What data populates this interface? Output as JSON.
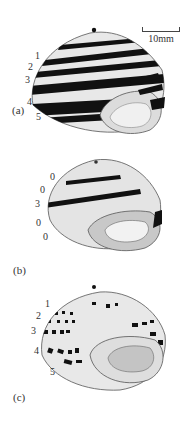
{
  "figure": {
    "scale_bar": {
      "label": "10mm"
    },
    "panels": [
      {
        "id": "a",
        "label": "(a)",
        "band_labels": [
          "1",
          "2",
          "3",
          "4",
          "5"
        ],
        "description": "Five-banded shell"
      },
      {
        "id": "b",
        "label": "(b)",
        "band_labels": [
          "0",
          "0",
          "3",
          "0",
          "0"
        ],
        "description": "Mid-banded shell (band 3 only)"
      },
      {
        "id": "c",
        "label": "(c)",
        "band_labels": [
          "1",
          "2",
          "3",
          "4",
          "5"
        ],
        "description": "Shell with interrupted (punctate) bands"
      }
    ],
    "colors": {
      "band": "#111111",
      "shell": "#e6e6e6",
      "aperture": "#bdbdbd",
      "outline": "#555555"
    }
  }
}
